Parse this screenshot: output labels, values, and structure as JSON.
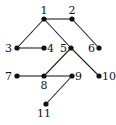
{
  "graph": {
    "type": "tree",
    "nodes": [
      {
        "id": "1",
        "label": "1"
      },
      {
        "id": "2",
        "label": "2"
      },
      {
        "id": "3",
        "label": "3"
      },
      {
        "id": "4",
        "label": "4"
      },
      {
        "id": "5",
        "label": "5"
      },
      {
        "id": "6",
        "label": "6"
      },
      {
        "id": "7",
        "label": "7"
      },
      {
        "id": "8",
        "label": "8"
      },
      {
        "id": "9",
        "label": "9"
      },
      {
        "id": "10",
        "label": "10"
      },
      {
        "id": "11",
        "label": "11"
      }
    ],
    "edges": [
      [
        "1",
        "2"
      ],
      [
        "1",
        "3"
      ],
      [
        "1",
        "5"
      ],
      [
        "2",
        "6"
      ],
      [
        "3",
        "4"
      ],
      [
        "5",
        "8"
      ],
      [
        "5",
        "10"
      ],
      [
        "7",
        "8"
      ],
      [
        "8",
        "9"
      ],
      [
        "9",
        "11"
      ]
    ],
    "colors": {
      "node": "#111111",
      "edge": "#222222"
    }
  }
}
